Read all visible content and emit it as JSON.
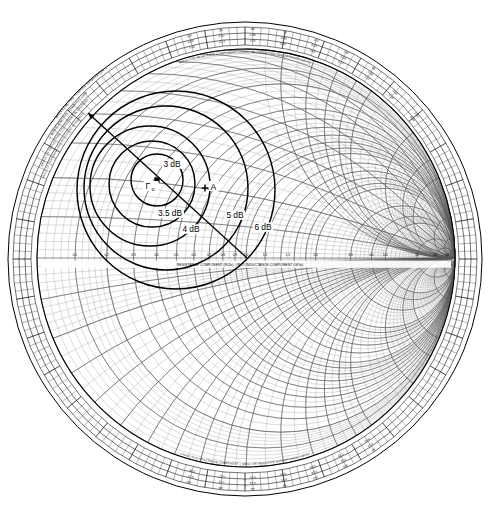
{
  "figure": {
    "type": "smith-chart",
    "width": 492,
    "height": 513,
    "background": "#ffffff",
    "line_color": "#000000",
    "grid_color": "#555555",
    "fine_grid_color": "#888888"
  },
  "geometry": {
    "outer_ring_center_x": 245,
    "outer_ring_center_y": 259,
    "outer_ring_radius": 237,
    "chart_center_x": 246,
    "chart_center_y": 258,
    "chart_radius": 209
  },
  "chart_data": {
    "type": "scatter",
    "xlabel": "RESISTANCE COMPONENT (R/Zo), OR CONDUCTANCE COMPONENT (G/Yo)",
    "ylabel": "",
    "xlim": [
      -1,
      1
    ],
    "ylim": [
      -1,
      1
    ],
    "grid": true,
    "legend": "none",
    "annotations": [
      {
        "name": "gamma-opt",
        "label": "Γ",
        "sub": "o",
        "x": 157,
        "y": 180,
        "marker": "square"
      },
      {
        "name": "point-a",
        "label": "A",
        "x": 205,
        "y": 188,
        "marker": "cross"
      }
    ],
    "noise_circles": [
      {
        "label": "3 dB",
        "value": 3.0,
        "cx": 157,
        "cy": 180,
        "r": 26,
        "label_x": 172,
        "label_y": 167
      },
      {
        "label": "3.5 dB",
        "value": 3.5,
        "cx": 152,
        "cy": 184,
        "r": 43,
        "label_x": 170,
        "label_y": 216
      },
      {
        "label": "4 dB",
        "value": 4.0,
        "cx": 150,
        "cy": 186,
        "r": 60,
        "label_x": 191,
        "label_y": 232
      },
      {
        "label": "5 dB",
        "value": 5.0,
        "cx": 166,
        "cy": 188,
        "r": 82,
        "label_x": 235,
        "label_y": 218
      },
      {
        "label": "6 dB",
        "value": 6.0,
        "cx": 176,
        "cy": 190,
        "r": 99,
        "label_x": 263,
        "label_y": 230
      }
    ],
    "radial_line": {
      "name": "gamma-radial-line",
      "x1": 88,
      "y1": 113,
      "x2": 247,
      "y2": 258
    },
    "resistance_ticks": [
      "0.1",
      "0.2",
      "0.3",
      "0.4",
      "0.5",
      "0.6",
      "0.7",
      "0.8",
      "0.9",
      "1.0",
      "1.2",
      "1.5",
      "2.0",
      "3.0",
      "4.0",
      "5.0",
      "10",
      "20",
      "50"
    ],
    "reactance_values": [
      "0.2",
      "0.4",
      "0.6",
      "0.8",
      "1.0",
      "1.5",
      "2.0",
      "3.0",
      "4.0",
      "5.0",
      "10",
      "20"
    ]
  },
  "scales": {
    "wavelengths_toward_generator": "← WAVELENGTHS TOWARD GENERATOR →",
    "wavelengths_toward_load": "← WAVELENGTHS TOWARD LOAD",
    "angle_of_reflection": "ANGLE OF REFLECTION COEFFICIENT IN DEGREES",
    "angle_of_transmission": "ANGLE OF TRANSMISSION COEFFICIENT IN DEGREES",
    "inductive_label": "INDUCTIVE REACTANCE COMPONENT (+jX/Zo), OR CAPACITIVE SUSCEPTANCE (+jB/Yo)",
    "capacitive_label": "CAPACITIVE REACTANCE COMPONENT (-jX/Zo), OR INDUCTIVE SUSCEPTANCE (-jB/Yo)",
    "resistance_axis": "RESISTANCE COMPONENT (R/Zo), OR CONDUCTANCE COMPONENT (G/Yo)",
    "wavelength_ticks_top": [
      "0.12",
      "0.13",
      "0.14",
      "0.15",
      "0.16",
      "0.17",
      "0.11",
      "0.10",
      "0.09"
    ],
    "wavelength_ticks_top_inner": [
      "0.38",
      "0.37",
      "0.36",
      "0.35",
      "0.34",
      "0.33",
      "0.39",
      "0.40",
      "0.41"
    ],
    "angle_ticks_top": [
      "100",
      "90",
      "80",
      "70",
      "110",
      "120",
      "60"
    ],
    "angle_ticks_bottom": [
      "-100",
      "-90",
      "-80",
      "-70",
      "-110",
      "-120",
      "-60"
    ],
    "wavelength_ticks_bottom": [
      "0.38",
      "0.37",
      "0.36",
      "0.35",
      "0.34",
      "0.39",
      "0.40"
    ],
    "wavelength_ticks_bottom_inner": [
      "0.12",
      "0.13",
      "0.14",
      "0.15",
      "0.16",
      "0.11",
      "0.10"
    ]
  }
}
